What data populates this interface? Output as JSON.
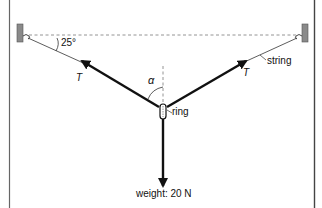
{
  "diagram": {
    "labels": {
      "angle_value": "25°",
      "tension_left": "T",
      "tension_right": "T",
      "string": "string",
      "alpha": "α",
      "ring": "ring",
      "weight": "weight: 20 N"
    },
    "colors": {
      "line": "#111111",
      "border": "#555555",
      "wall": "#8a8a8a",
      "dashed": "#888888"
    }
  }
}
